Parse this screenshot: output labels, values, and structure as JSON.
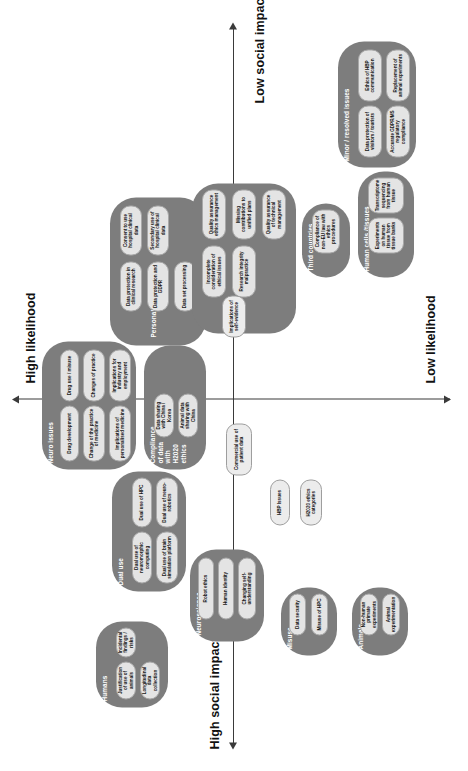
{
  "figure": {
    "type": "quadrant-matrix",
    "orientation": "page rotated 90 degrees counter-clockwise",
    "axes": {
      "x_left_label": "High social impact",
      "x_right_label": "Low social impact",
      "y_top_label": "High likelihood",
      "y_bottom_label": "Low likelihood"
    },
    "colors": {
      "cluster_fill": "#7d7d7d",
      "pill_fill": "#e4e4e4",
      "pill_border": "#a8a8a8",
      "axis": "#3a3a3a",
      "background": "#ffffff",
      "cluster_title": "#ffffff"
    }
  },
  "clusters": [
    {
      "name": "Neuroscience",
      "items": [
        "Robot ethics",
        "Human identity",
        "Changing self-understanding"
      ]
    },
    {
      "name": "Dual use",
      "items": [
        "Dual use of neuromorphic computing",
        "Dual use of HPC",
        "Dual use of brain simulation platform",
        "Dual use of neuro-robotics"
      ]
    },
    {
      "name": "Misuse",
      "items": [
        "Data security",
        "Misuse of HPC"
      ]
    },
    {
      "name": "Animals",
      "items": [
        "Non-human primate experiments",
        "Animal experimentation"
      ]
    },
    {
      "name": "Humans",
      "items": [
        "Justification of use of animals",
        "Incidental findings / risks",
        "Longitudinal data collection"
      ]
    },
    {
      "name": "Neuro issues",
      "items": [
        "Drug development",
        "Drug use / misuse",
        "Change of the practice of medicine",
        "Changes of practice",
        "Implications of personalised medicine",
        "Implications for industry and employment"
      ]
    },
    {
      "name": "Compliance of data with H2020 ethics",
      "items": [
        "Data sharing with China / Korea",
        "Animal data sharing with China"
      ]
    },
    {
      "name": "Personal data",
      "items": [
        "Data protection in clinical research",
        "Consent to use hospital clinical data",
        "Data protection and GDPR",
        "Secondary use of hospital clinical data",
        "Data set processing"
      ]
    },
    {
      "name": "HBP Ethics Management",
      "items": [
        "Incomplete consideration of ethical issues",
        "Quality assurance ethics management",
        "Research integrity malpractice",
        "Missing contributions to unified plans",
        "Quality assurance of technical management"
      ]
    },
    {
      "name": "Third countries",
      "items": [
        "Compliance of non-EU law with ethics procedures"
      ]
    },
    {
      "name": "Human cells /tissues",
      "items": [
        "Experiments on human tissue from tissue banks",
        "Transcriptome sequencing from human tissue"
      ]
    },
    {
      "name": "Minor / resolved issues",
      "items": [
        "Data protection of visitors / tourists",
        "Ethics of HBP communication",
        "Accurate GDPR/MS regulatory compliance",
        "Replacement of animal experiments"
      ]
    }
  ],
  "standalone_items": [
    "Commercial use of patient data",
    "HBP Issues",
    "H2020 ethics categories",
    "Implications of self-evidence"
  ]
}
